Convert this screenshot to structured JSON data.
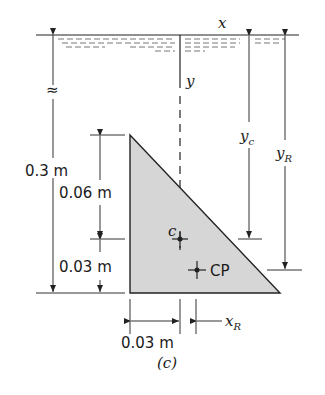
{
  "figure": {
    "caption": "(c)",
    "colors": {
      "plate_fill": "#d6d6d6",
      "line": "#222222"
    }
  },
  "axes": {
    "x_label": "x",
    "y_label": "y"
  },
  "dimensions": {
    "depth_to_top": "0.3 m",
    "height_upper": "0.06 m",
    "height_lower": "0.03 m",
    "width_to_centroid": "0.03 m",
    "break_symbol": "≈"
  },
  "labels": {
    "centroid": "c",
    "center_of_pressure": "CP",
    "yc_main": "y",
    "yc_sub": "c",
    "yR_main": "y",
    "yR_sub": "R",
    "xR_main": "x",
    "xR_sub": "R"
  }
}
